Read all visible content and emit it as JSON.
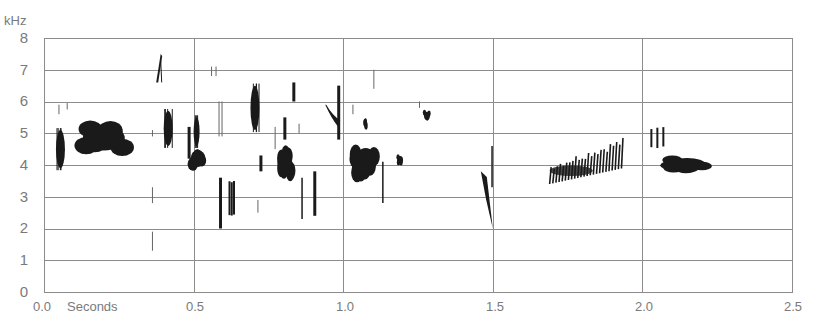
{
  "chart_data": {
    "type": "heatmap",
    "subtype": "spectrogram",
    "title": "",
    "ylabel": "kHz",
    "xlabel": "Seconds",
    "xlim": [
      0.0,
      2.5
    ],
    "ylim": [
      0,
      8
    ],
    "x_ticks": [
      "0.0",
      "0.5",
      "1.0",
      "1.5",
      "2.0",
      "2.5"
    ],
    "x_tick_values": [
      0.0,
      0.5,
      1.0,
      1.5,
      2.0,
      2.5
    ],
    "y_ticks": [
      "0",
      "1",
      "2",
      "3",
      "4",
      "5",
      "6",
      "7",
      "8"
    ],
    "y_tick_values": [
      0,
      1,
      2,
      3,
      4,
      5,
      6,
      7,
      8
    ],
    "grid": {
      "horizontal": true,
      "vertical_at": [
        0.5,
        1.0,
        1.5,
        2.0
      ]
    },
    "colors": {
      "ink": "#1a1a1a",
      "grid": "#8c8c8c",
      "labels": "#7a7a7a",
      "background": "#ffffff"
    },
    "events": [
      {
        "label": "note-1",
        "t": [
          0.04,
          0.07
        ],
        "f": [
          3.9,
          5.1
        ],
        "shape": "vertical-burst"
      },
      {
        "label": "note-2",
        "t": [
          0.045,
          0.055
        ],
        "f": [
          5.6,
          5.9
        ],
        "shape": "faint-tick"
      },
      {
        "label": "note-3",
        "t": [
          0.07,
          0.085
        ],
        "f": [
          5.75,
          5.95
        ],
        "shape": "faint-tick"
      },
      {
        "label": "note-4",
        "t": [
          0.13,
          0.27
        ],
        "f": [
          4.4,
          5.3
        ],
        "shape": "broad-blob"
      },
      {
        "label": "note-5",
        "t": [
          0.375,
          0.39
        ],
        "f": [
          6.6,
          7.5
        ],
        "shape": "rising-stroke"
      },
      {
        "label": "note-6",
        "t": [
          0.4,
          0.43
        ],
        "f": [
          4.6,
          5.7
        ],
        "shape": "vertical-burst"
      },
      {
        "label": "note-7",
        "t": [
          0.36,
          0.365
        ],
        "f": [
          4.9,
          5.1
        ],
        "shape": "faint-tick"
      },
      {
        "label": "note-8",
        "t": [
          0.36,
          0.365
        ],
        "f": [
          2.8,
          3.3
        ],
        "shape": "faint-tick"
      },
      {
        "label": "note-9",
        "t": [
          0.36,
          0.365
        ],
        "f": [
          1.3,
          1.9
        ],
        "shape": "faint-tick"
      },
      {
        "label": "note-10",
        "t": [
          0.48,
          0.49
        ],
        "f": [
          4.2,
          5.2
        ],
        "shape": "vertical-stroke"
      },
      {
        "label": "note-11",
        "t": [
          0.5,
          0.52
        ],
        "f": [
          4.6,
          5.5
        ],
        "shape": "vertical-burst"
      },
      {
        "label": "note-12",
        "t": [
          0.49,
          0.54
        ],
        "f": [
          3.9,
          4.5
        ],
        "shape": "blob"
      },
      {
        "label": "note-13",
        "t": [
          0.56,
          0.575
        ],
        "f": [
          6.8,
          7.1
        ],
        "shape": "faint-ticks"
      },
      {
        "label": "note-14",
        "t": [
          0.585,
          0.59
        ],
        "f": [
          4.9,
          6.0
        ],
        "shape": "faint-ticks"
      },
      {
        "label": "note-15",
        "t": [
          0.585,
          0.595
        ],
        "f": [
          2.0,
          3.6
        ],
        "shape": "vertical-stroke"
      },
      {
        "label": "note-16",
        "t": [
          0.62,
          0.635
        ],
        "f": [
          2.4,
          3.5
        ],
        "shape": "vertical-strokes"
      },
      {
        "label": "note-17",
        "t": [
          0.69,
          0.72
        ],
        "f": [
          5.1,
          6.5
        ],
        "shape": "vertical-burst"
      },
      {
        "label": "note-18",
        "t": [
          0.72,
          0.73
        ],
        "f": [
          3.8,
          4.3
        ],
        "shape": "vertical-stroke"
      },
      {
        "label": "note-19",
        "t": [
          0.71,
          0.72
        ],
        "f": [
          2.5,
          2.9
        ],
        "shape": "faint-tick"
      },
      {
        "label": "note-20",
        "t": [
          0.77,
          0.775
        ],
        "f": [
          4.5,
          5.2
        ],
        "shape": "faint-tick"
      },
      {
        "label": "note-21",
        "t": [
          0.78,
          0.83
        ],
        "f": [
          3.6,
          4.5
        ],
        "shape": "blob"
      },
      {
        "label": "note-22",
        "t": [
          0.8,
          0.81
        ],
        "f": [
          4.8,
          5.5
        ],
        "shape": "vertical-stroke"
      },
      {
        "label": "note-23",
        "t": [
          0.83,
          0.84
        ],
        "f": [
          6.0,
          6.6
        ],
        "shape": "vertical-stroke"
      },
      {
        "label": "note-24",
        "t": [
          0.85,
          0.855
        ],
        "f": [
          5.0,
          5.3
        ],
        "shape": "faint-tick"
      },
      {
        "label": "note-25",
        "t": [
          0.86,
          0.865
        ],
        "f": [
          2.3,
          3.6
        ],
        "shape": "vertical-stroke"
      },
      {
        "label": "note-26",
        "t": [
          0.9,
          0.91
        ],
        "f": [
          2.4,
          3.8
        ],
        "shape": "vertical-stroke"
      },
      {
        "label": "note-27",
        "t": [
          0.94,
          0.99
        ],
        "f": [
          5.2,
          5.9
        ],
        "shape": "descending-hook"
      },
      {
        "label": "note-28",
        "t": [
          0.98,
          0.99
        ],
        "f": [
          4.8,
          6.5
        ],
        "shape": "vertical-stroke"
      },
      {
        "label": "note-29",
        "t": [
          1.03,
          1.035
        ],
        "f": [
          5.6,
          5.9
        ],
        "shape": "faint-tick"
      },
      {
        "label": "note-30",
        "t": [
          1.07,
          1.08
        ],
        "f": [
          5.1,
          5.5
        ],
        "shape": "small-blob"
      },
      {
        "label": "note-31",
        "t": [
          1.1,
          1.105
        ],
        "f": [
          6.4,
          7.0
        ],
        "shape": "faint-tick"
      },
      {
        "label": "note-32",
        "t": [
          1.04,
          1.11
        ],
        "f": [
          3.6,
          4.6
        ],
        "shape": "blob"
      },
      {
        "label": "note-33",
        "t": [
          1.13,
          1.135
        ],
        "f": [
          2.8,
          4.1
        ],
        "shape": "vertical-stroke"
      },
      {
        "label": "note-34",
        "t": [
          1.18,
          1.2
        ],
        "f": [
          4.0,
          4.3
        ],
        "shape": "small-blob"
      },
      {
        "label": "note-35",
        "t": [
          1.25,
          1.26
        ],
        "f": [
          5.8,
          6.0
        ],
        "shape": "faint-tick"
      },
      {
        "label": "note-36",
        "t": [
          1.27,
          1.29
        ],
        "f": [
          5.4,
          5.7
        ],
        "shape": "small-blob"
      },
      {
        "label": "note-37",
        "t": [
          1.46,
          1.5
        ],
        "f": [
          2.0,
          3.8
        ],
        "shape": "descending-sweep"
      },
      {
        "label": "note-38",
        "t": [
          1.495,
          1.5
        ],
        "f": [
          3.3,
          4.6
        ],
        "shape": "vertical-stroke"
      },
      {
        "label": "note-39",
        "t": [
          1.69,
          1.93
        ],
        "f": [
          3.4,
          4.8
        ],
        "shape": "rising-trill"
      },
      {
        "label": "note-40",
        "t": [
          2.03,
          2.07
        ],
        "f": [
          4.5,
          5.2
        ],
        "shape": "vertical-strokes"
      },
      {
        "label": "note-41",
        "t": [
          2.09,
          2.21
        ],
        "f": [
          3.8,
          4.25
        ],
        "shape": "blob"
      }
    ]
  },
  "axes": {
    "y_unit_label": "kHz",
    "x_unit_label": "Seconds",
    "x_tick_labels": [
      "0.0",
      "0.5",
      "1.0",
      "1.5",
      "2.0",
      "2.5"
    ],
    "y_tick_labels": [
      "0",
      "1",
      "2",
      "3",
      "4",
      "5",
      "6",
      "7",
      "8"
    ]
  }
}
